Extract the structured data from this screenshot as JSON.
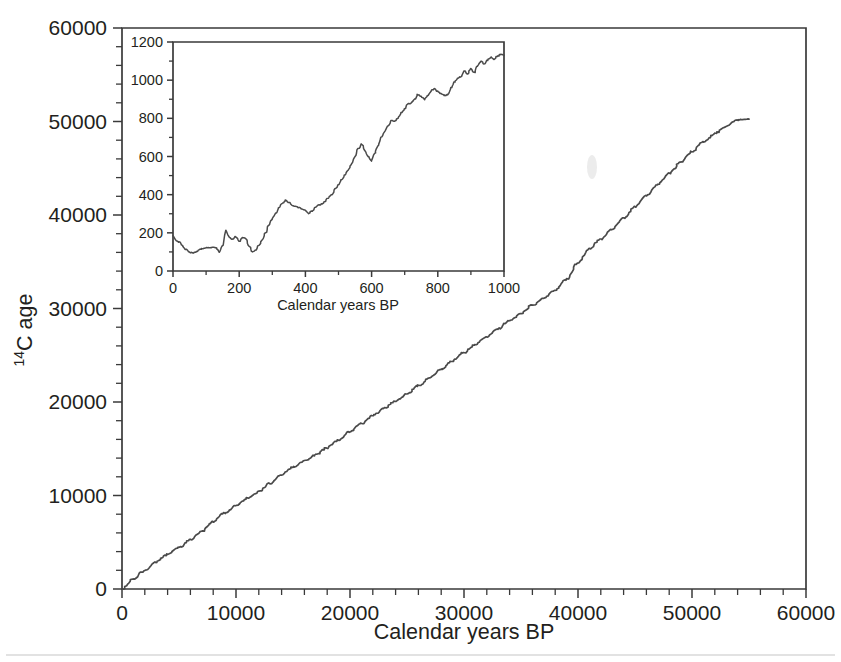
{
  "figure": {
    "background_color": "#ffffff",
    "line_color": "#4a4a4a",
    "axis_color": "#3a3a3a"
  },
  "main_axis": {
    "xlabel": "Calendar years BP",
    "ylabel_prefix": "14",
    "ylabel_rest": "C age",
    "ylabel_full": "14C age",
    "x_ticklabels": [
      "0",
      "10000",
      "20000",
      "30000",
      "40000",
      "50000",
      "60000"
    ],
    "y_ticklabels": [
      "0",
      "10000",
      "20000",
      "30000",
      "40000",
      "50000",
      "60000"
    ]
  },
  "inset_axis": {
    "xlabel": "Calendar years BP",
    "x_ticklabels": [
      "0",
      "200",
      "400",
      "600",
      "800",
      "1000"
    ],
    "y_ticklabels": [
      "0",
      "200",
      "400",
      "600",
      "800",
      "1000",
      "1200"
    ]
  },
  "chart_data": [
    {
      "id": "main",
      "type": "line",
      "title": "",
      "xlabel": "Calendar years BP",
      "ylabel": "14C age",
      "xlim": [
        0,
        60000
      ],
      "ylim": [
        0,
        60000
      ],
      "xticks": [
        0,
        10000,
        20000,
        30000,
        40000,
        50000,
        60000
      ],
      "yticks": [
        0,
        10000,
        20000,
        30000,
        40000,
        50000,
        60000
      ],
      "x_minor_tick_step": 2000,
      "y_minor_tick_step": 2000,
      "grid": false,
      "legend": "none",
      "series": [
        {
          "name": "IntCal radiocarbon calibration curve",
          "x": [
            0,
            1000,
            2000,
            3000,
            4000,
            5000,
            6000,
            7000,
            8000,
            9000,
            10000,
            11000,
            12000,
            13000,
            14000,
            15000,
            16000,
            17000,
            18000,
            19000,
            20000,
            21000,
            22000,
            23000,
            24000,
            25000,
            26000,
            27000,
            28000,
            29000,
            30000,
            31000,
            32000,
            33000,
            34000,
            35000,
            36000,
            37000,
            38000,
            39000,
            40000,
            41000,
            42000,
            43000,
            44000,
            45000,
            46000,
            47000,
            48000,
            49000,
            50000,
            51000,
            52000,
            53000,
            54000,
            55000
          ],
          "y": [
            0,
            1050,
            2000,
            2900,
            3700,
            4450,
            5250,
            6150,
            7200,
            8100,
            8900,
            9700,
            10400,
            11300,
            12250,
            13050,
            13700,
            14350,
            15100,
            15950,
            16800,
            17700,
            18550,
            19350,
            20100,
            20900,
            21750,
            22600,
            23500,
            24400,
            25300,
            26150,
            27000,
            27850,
            28700,
            29500,
            30350,
            31100,
            31950,
            33100,
            34900,
            36400,
            37400,
            38500,
            39700,
            40900,
            42100,
            43300,
            44450,
            45600,
            46800,
            47800,
            48700,
            49500,
            50150,
            50250
          ]
        }
      ]
    },
    {
      "id": "inset",
      "type": "line",
      "title": "",
      "xlabel": "Calendar years BP",
      "ylabel": "",
      "xlim": [
        0,
        1000
      ],
      "ylim": [
        0,
        1200
      ],
      "xticks": [
        0,
        200,
        400,
        600,
        800,
        1000
      ],
      "yticks": [
        0,
        200,
        400,
        600,
        800,
        1000,
        1200
      ],
      "x_minor_tick_step": 100,
      "y_minor_tick_step": 100,
      "grid": false,
      "legend": "none",
      "series": [
        {
          "name": "IntCal radiocarbon calibration curve (last 1000 yr)",
          "x": [
            0,
            10,
            20,
            30,
            40,
            50,
            60,
            70,
            80,
            90,
            100,
            110,
            120,
            130,
            140,
            150,
            160,
            170,
            180,
            190,
            200,
            210,
            220,
            230,
            240,
            250,
            260,
            270,
            280,
            290,
            300,
            310,
            320,
            330,
            340,
            350,
            360,
            370,
            380,
            390,
            400,
            410,
            420,
            430,
            440,
            450,
            460,
            470,
            480,
            490,
            500,
            510,
            520,
            530,
            540,
            550,
            560,
            570,
            580,
            590,
            600,
            610,
            620,
            630,
            640,
            650,
            660,
            670,
            680,
            690,
            700,
            710,
            720,
            730,
            740,
            750,
            760,
            770,
            780,
            790,
            800,
            810,
            820,
            830,
            840,
            850,
            860,
            870,
            880,
            890,
            900,
            910,
            920,
            930,
            940,
            950,
            960,
            970,
            980,
            990,
            1000
          ],
          "y": [
            185,
            160,
            150,
            130,
            112,
            98,
            95,
            100,
            112,
            118,
            122,
            120,
            124,
            122,
            100,
            130,
            215,
            175,
            165,
            180,
            155,
            175,
            170,
            130,
            100,
            110,
            135,
            165,
            200,
            240,
            275,
            300,
            330,
            355,
            370,
            360,
            345,
            340,
            332,
            325,
            318,
            300,
            315,
            335,
            345,
            352,
            365,
            385,
            400,
            430,
            455,
            480,
            505,
            530,
            560,
            600,
            640,
            665,
            630,
            600,
            575,
            620,
            660,
            700,
            730,
            760,
            790,
            785,
            800,
            830,
            850,
            875,
            880,
            900,
            925,
            915,
            900,
            920,
            945,
            955,
            940,
            930,
            920,
            925,
            960,
            990,
            1010,
            1020,
            1050,
            1030,
            1060,
            1040,
            1075,
            1100,
            1085,
            1105,
            1120,
            1110,
            1125,
            1135,
            1130
          ]
        }
      ]
    }
  ]
}
